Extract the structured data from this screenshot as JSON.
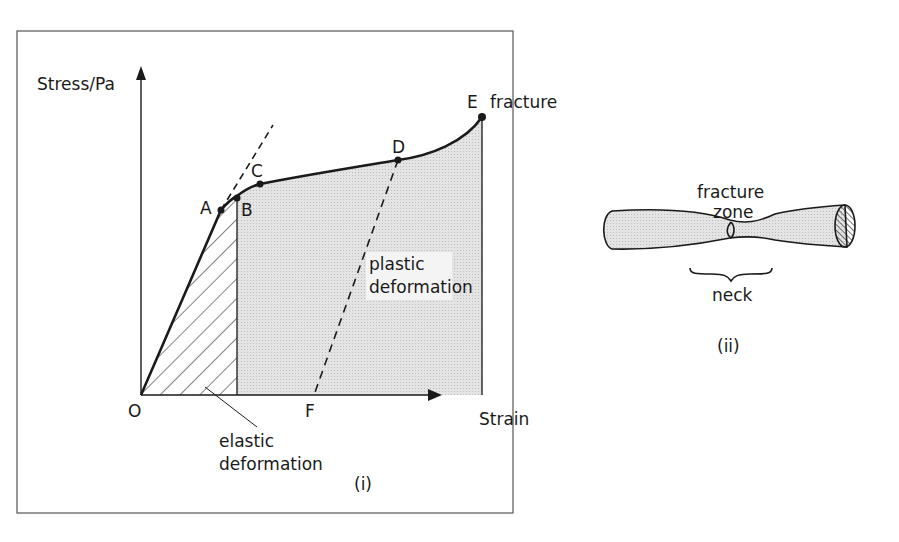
{
  "figure": {
    "panel_i": {
      "caption": "(i)",
      "y_axis_label": "Stress/Pa",
      "x_axis_label": "Strain",
      "origin_label": "O",
      "points": {
        "A": "A",
        "B": "B",
        "C": "C",
        "D": "D",
        "E": "E",
        "F": "F"
      },
      "fracture_label": "fracture",
      "plastic_label_line1": "plastic",
      "plastic_label_line2": "deformation",
      "elastic_label_line1": "elastic",
      "elastic_label_line2": "deformation"
    },
    "panel_ii": {
      "caption": "(ii)",
      "fracture_zone_line1": "fracture",
      "fracture_zone_line2": "zone",
      "neck_label": "neck"
    },
    "colors": {
      "ink": "#1a1a1a",
      "shade": "#dcdcdc",
      "frame": "#555555",
      "background": "#ffffff"
    }
  }
}
